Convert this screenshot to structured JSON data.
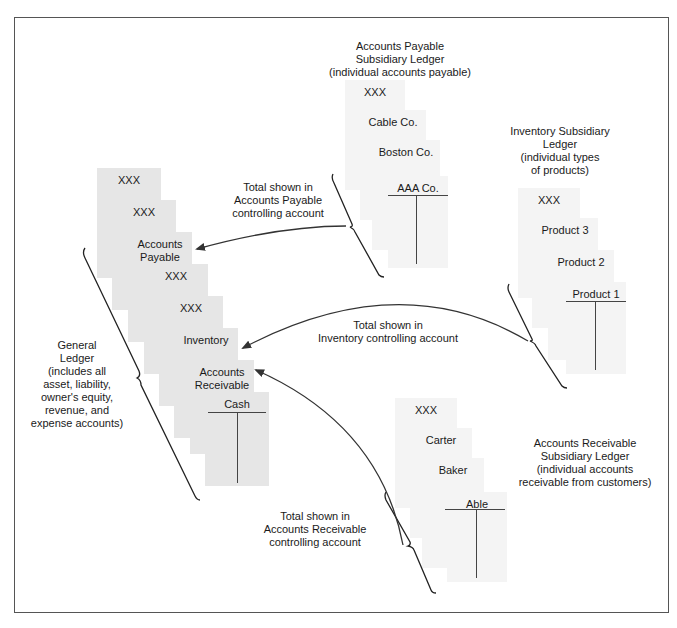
{
  "general_ledger": {
    "caption": [
      "General",
      "Ledger",
      "(includes all",
      "asset, liability,",
      "owner's equity,",
      "revenue, and",
      "expense accounts)"
    ],
    "accounts": [
      {
        "label": "XXX"
      },
      {
        "label": "XXX"
      },
      {
        "label": "Accounts Payable"
      },
      {
        "label": "XXX"
      },
      {
        "label": "XXX"
      },
      {
        "label": "Inventory"
      },
      {
        "label": "Accounts Receivable"
      },
      {
        "label": "Cash"
      }
    ]
  },
  "accounts_payable_ledger": {
    "title": [
      "Accounts Payable",
      "Subsidiary Ledger",
      "(individual accounts payable)"
    ],
    "accounts": [
      {
        "label": "XXX"
      },
      {
        "label": "Cable Co."
      },
      {
        "label": "Boston Co."
      },
      {
        "label": "AAA Co."
      }
    ],
    "arrow_label": [
      "Total shown in",
      "Accounts Payable",
      "controlling account"
    ]
  },
  "inventory_ledger": {
    "title": [
      "Inventory Subsidiary",
      "Ledger",
      "(individual types",
      "of products)"
    ],
    "accounts": [
      {
        "label": "XXX"
      },
      {
        "label": "Product 3"
      },
      {
        "label": "Product 2"
      },
      {
        "label": "Product 1"
      }
    ],
    "arrow_label": [
      "Total shown in",
      "Inventory controlling account"
    ]
  },
  "accounts_receivable_ledger": {
    "title": [
      "Accounts Receivable",
      "Subsidiary Ledger",
      "(individual accounts",
      "receivable from customers)"
    ],
    "accounts": [
      {
        "label": "XXX"
      },
      {
        "label": "Carter"
      },
      {
        "label": "Baker"
      },
      {
        "label": "Able"
      }
    ],
    "arrow_label": [
      "Total shown in",
      "Accounts Receivable",
      "controlling account"
    ]
  },
  "colors": {
    "card_fill": "#e6e6e6",
    "sub_card_fill": "#f4f4f4",
    "line": "#333333",
    "border": "#555555"
  }
}
